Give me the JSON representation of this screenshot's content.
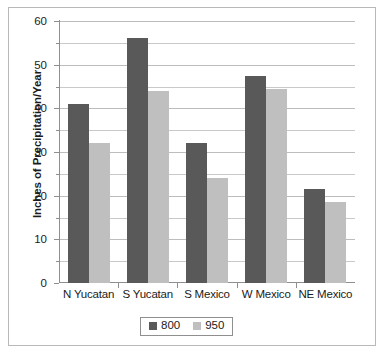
{
  "chart_data": {
    "type": "bar",
    "title": "",
    "subtitle": "",
    "xlabel": "",
    "ylabel": "Inches of Precipitation/Year",
    "categories": [
      "N Yucatan",
      "S Yucatan",
      "S Mexico",
      "W Mexico",
      "NE Mexico"
    ],
    "series": [
      {
        "name": "800",
        "color": "#595959",
        "values": [
          41,
          56,
          32,
          47.5,
          21.5
        ]
      },
      {
        "name": "950",
        "color": "#bfbfbf",
        "values": [
          32,
          44,
          24,
          44.5,
          18.5
        ]
      }
    ],
    "ylim": [
      0,
      60
    ],
    "ytick_labels": [
      "0",
      "10",
      "20",
      "30",
      "40",
      "50",
      "60"
    ],
    "ytick_values": [
      0,
      10,
      20,
      30,
      40,
      50,
      60
    ],
    "minor_tick_values": [
      5,
      15,
      25,
      35,
      45,
      55
    ],
    "grid": true,
    "grid_axis": "y",
    "legend_position": "bottom",
    "legend_entries": [
      "800",
      "950"
    ]
  },
  "figure": {
    "border_color": "#b9b9b9",
    "background": "#ffffff",
    "axis_color": "#8f8f8f",
    "gridline_color": "#c9c9c9",
    "text_color": "#1b1b1b"
  }
}
